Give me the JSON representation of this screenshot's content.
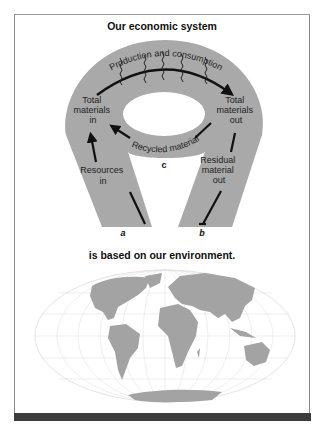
{
  "titles": {
    "top": "Our economic system",
    "bottom": "is based on our environment."
  },
  "diagram": {
    "arc_label": "Production and consumption",
    "recycle_label": "Recycled material",
    "left_upper": [
      "Total",
      "materials",
      "in"
    ],
    "left_lower": [
      "Resources",
      "in"
    ],
    "right_upper": [
      "Total",
      "materials",
      "out"
    ],
    "right_lower": [
      "Residual",
      "material",
      "out"
    ],
    "point_a": "a",
    "point_b": "b",
    "point_c": "c"
  },
  "colors": {
    "band": "#a9a9a9",
    "land": "#a3a3a3",
    "grid": "#dedede",
    "bar": "#3c3c3c"
  }
}
